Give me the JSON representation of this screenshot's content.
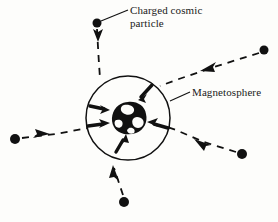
{
  "figure": {
    "title_visible": false,
    "background_color": "#fdfdfb",
    "ink_color": "#111111",
    "width": 278,
    "height": 222
  },
  "labels": {
    "charged_particle": "Charged cosmic\nparticle",
    "magnetosphere": "Magnetosphere"
  },
  "diagram": {
    "magnetosphere_circle": {
      "name": "magnetosphere-boundary",
      "center_x": 128,
      "center_y": 118,
      "radius": 42,
      "stroke_width": 1.4,
      "fill": "none"
    },
    "earth": {
      "name": "earth-globe",
      "center_x": 128,
      "center_y": 117,
      "radius": 15
    },
    "incoming_particles": [
      {
        "name": "particle-top",
        "dot_x": 97,
        "dot_y": 23,
        "dot_r": 4,
        "direction": "down",
        "path": "M 97,27 L 98,45 L 99,62 L 100,76",
        "arrow_x": 98,
        "arrow_y": 37,
        "arrow_angle": 92
      },
      {
        "name": "particle-upper-right",
        "dot_x": 264,
        "dot_y": 50,
        "dot_r": 4,
        "direction": "down-left",
        "path": "M 260,52 L 215,66 L 176,80 L 158,86",
        "arrow_x": 212,
        "arrow_y": 67,
        "arrow_angle": 198
      },
      {
        "name": "particle-left",
        "dot_x": 15,
        "dot_y": 139,
        "dot_r": 5,
        "direction": "right",
        "path": "M 21,138 L 55,134 L 86,128",
        "arrow_x": 41,
        "arrow_y": 136,
        "arrow_angle": 351
      },
      {
        "name": "particle-lower-right",
        "dot_x": 242,
        "dot_y": 154,
        "dot_r": 5,
        "direction": "up-left",
        "path": "M 237,152 L 205,142 L 175,130 L 163,126",
        "arrow_x": 206,
        "arrow_y": 143,
        "arrow_angle": 200
      },
      {
        "name": "particle-bottom",
        "dot_x": 124,
        "dot_y": 202,
        "dot_r": 5,
        "direction": "up",
        "path": "M 123,197 L 118,180 L 114,167",
        "arrow_x": 116,
        "arrow_y": 173,
        "arrow_angle": 250
      }
    ],
    "deflection_arrows": [
      {
        "name": "deflect-arrow-upper",
        "x": 140,
        "y": 95,
        "angle": 225,
        "length": 16
      },
      {
        "name": "deflect-arrow-left-upper",
        "x": 106,
        "y": 108,
        "angle": 355,
        "length": 17
      },
      {
        "name": "deflect-arrow-left-lower",
        "x": 104,
        "y": 124,
        "angle": 5,
        "length": 17
      },
      {
        "name": "deflect-arrow-right",
        "x": 152,
        "y": 124,
        "angle": 190,
        "length": 16
      },
      {
        "name": "deflect-arrow-bottom",
        "x": 122,
        "y": 140,
        "angle": 290,
        "length": 16
      }
    ],
    "leader_lines": [
      {
        "name": "leader-charged-particle",
        "x1": 101,
        "y1": 21,
        "x2": 127,
        "y2": 10
      },
      {
        "name": "leader-magnetosphere",
        "x1": 170,
        "y1": 100,
        "x2": 190,
        "y2": 92
      }
    ]
  }
}
